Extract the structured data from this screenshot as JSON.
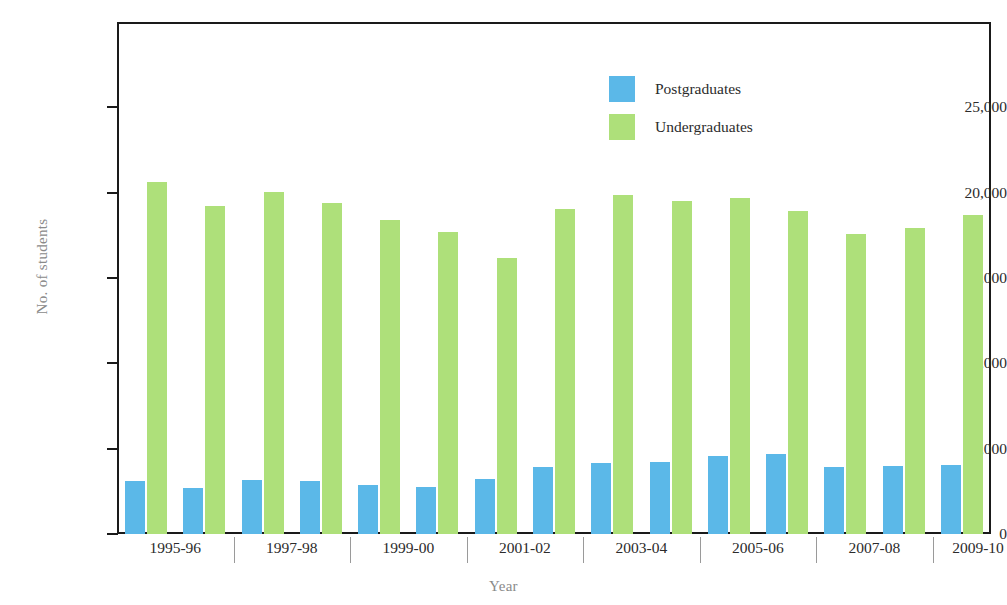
{
  "chart_data": {
    "type": "bar",
    "title": "",
    "xlabel": "Year",
    "ylabel": "No. of students",
    "ylim": [
      0,
      30000
    ],
    "yticks": [
      0,
      5000,
      10000,
      15000,
      20000,
      25000
    ],
    "ytick_labels": [
      "0",
      "5,000",
      "10,000",
      "15,000",
      "20,000",
      "25,000"
    ],
    "grid": false,
    "legend_position": "top-right",
    "categories": [
      "1995-96",
      "1996-97",
      "1997-98",
      "1998-99",
      "1999-00",
      "2000-01",
      "2001-02",
      "2002-03",
      "2003-04",
      "2004-05",
      "2005-06",
      "2006-07",
      "2007-08",
      "2008-09",
      "2009-10"
    ],
    "xtick_labels": [
      "1995-96",
      "1997-98",
      "1999-00",
      "2001-02",
      "2003-04",
      "2005-06",
      "2007-08",
      "2009-10"
    ],
    "series": [
      {
        "name": "Postgraduates",
        "color": "#5bb8e8",
        "values": [
          3100,
          2700,
          3150,
          3100,
          2900,
          2750,
          3200,
          3950,
          4150,
          4200,
          4600,
          4700,
          3950,
          4000,
          4050
        ]
      },
      {
        "name": "Undergraduates",
        "color": "#aee07a",
        "values": [
          20600,
          19200,
          20050,
          19400,
          18400,
          17700,
          16200,
          19050,
          19850,
          19500,
          19700,
          18950,
          17600,
          17950,
          18700
        ]
      }
    ]
  },
  "legend": {
    "items": [
      {
        "label": "Postgraduates",
        "color": "#5bb8e8"
      },
      {
        "label": "Undergraduates",
        "color": "#aee07a"
      }
    ]
  },
  "axes": {
    "y_title": "No. of students",
    "x_title": "Year"
  }
}
